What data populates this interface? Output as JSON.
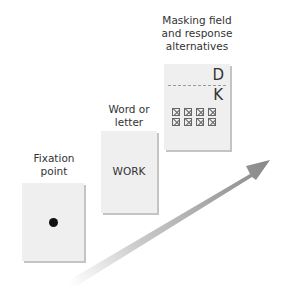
{
  "stages": [
    {
      "label_line1": "Fixation",
      "label_line2": "point",
      "content": "fixation-dot"
    },
    {
      "label_line1": "Word or",
      "label_line2": "letter",
      "content": "WORK"
    },
    {
      "label_line1": "Masking field",
      "label_line2": "and response",
      "label_line3": "alternatives",
      "letters": [
        "D",
        "K"
      ]
    }
  ],
  "arrow": {
    "label": "Time",
    "color": "#888888"
  }
}
